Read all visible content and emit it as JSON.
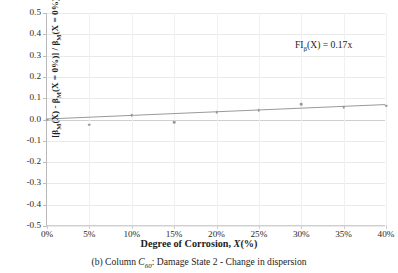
{
  "chart_data": {
    "type": "scatter",
    "title": "",
    "xlabel": "Degree of Corrosion, X(%)",
    "ylabel": "[β_M(X) - β_M(X = 0%)] / β_M(X = 0%)",
    "xlim": [
      0,
      40
    ],
    "ylim": [
      -0.5,
      0.5
    ],
    "grid": true,
    "legend": "none",
    "x_unit": "%",
    "categories": [
      "0%",
      "5%",
      "10%",
      "15%",
      "20%",
      "25%",
      "30%",
      "35%",
      "40%"
    ],
    "x_tick_labels": [
      "0%",
      "5%",
      "10%",
      "15%",
      "20%",
      "25%",
      "30%",
      "35%",
      "40%"
    ],
    "x_tick_values": [
      0,
      5,
      10,
      15,
      20,
      25,
      30,
      35,
      40
    ],
    "y_tick_labels": [
      "0.5",
      "0.4",
      "0.3",
      "0.2",
      "0.1",
      "0.0",
      "-0.1",
      "-0.2",
      "-0.3",
      "-0.4",
      "-0.5"
    ],
    "y_tick_values": [
      0.5,
      0.4,
      0.3,
      0.2,
      0.1,
      0.0,
      -0.1,
      -0.2,
      -0.3,
      -0.4,
      -0.5
    ],
    "series": [
      {
        "name": "Change in dispersion",
        "marker": "circle",
        "color": "#9a9a9a",
        "x": [
          0,
          5,
          10,
          15,
          20,
          25,
          30,
          35,
          40
        ],
        "values": [
          0.0,
          -0.025,
          0.019,
          -0.012,
          0.034,
          0.045,
          0.072,
          0.059,
          0.065
        ]
      },
      {
        "name": "Linear trendline",
        "type": "line",
        "color": "#9a9a9a",
        "x": [
          0,
          40
        ],
        "values": [
          0.0,
          0.068
        ]
      }
    ],
    "annotations": [
      {
        "name": "trendline-equation",
        "text": "FIβ(X) = 0.17x",
        "prefix": "FI",
        "subscript": "β",
        "suffix": "(X) = 0.17x",
        "x": 0.78,
        "y": 0.43
      }
    ]
  },
  "axes": {
    "y_title_pre": "[β",
    "y_title_sub1": "M",
    "y_title_mid1": "(X) - β",
    "y_title_sub2": "M",
    "y_title_mid2": "(X = 0%)] / β",
    "y_title_sub3": "M",
    "y_title_end": "(X = 0%)",
    "x_title_main": "Degree of Corrosion, ",
    "x_title_italic": "X",
    "x_title_tail": "(%)"
  },
  "equation": {
    "prefix": "FI",
    "subscript": "β",
    "body": "(X)  =  0.17x"
  },
  "caption": {
    "label": "(b) Column ",
    "symbol": "C",
    "symbol_sub": "60",
    "text": ": Damage State 2 - Change in dispersion"
  },
  "colors": {
    "marker": "#9a9a9a",
    "trendline": "#9a9a9a",
    "gridline": "#e9e9e9",
    "axis": "#bdbdbd",
    "text": "#1d1d1d"
  }
}
